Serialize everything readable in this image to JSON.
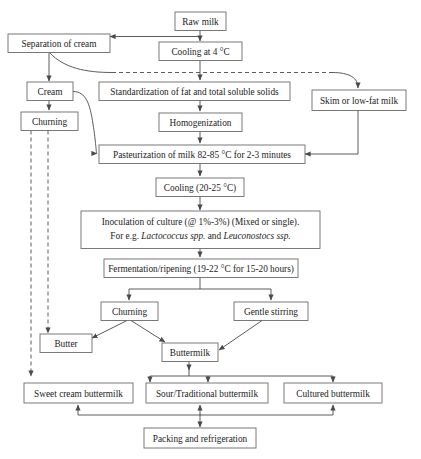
{
  "diagram": {
    "type": "process-flowchart",
    "colors": {
      "box_stroke": "#6b6b6b",
      "edge_stroke": "#4a4a4a",
      "box_fill": "#ffffff",
      "text": "#1b1b1b",
      "background": "#ffffff"
    },
    "nodes": {
      "raw_milk": "Raw milk",
      "separation_of_cream": "Separation of cream",
      "cooling_4c": "Cooling at 4 °C",
      "cream": "Cream",
      "standardization": "Standardization of fat and total soluble solids",
      "skim_milk": "Skim or low-fat milk",
      "churning_top": "Churning",
      "homogenization": "Homogenization",
      "pasteurization": "Pasteurization of milk 82-85 °C for 2-3 minutes",
      "cooling_20_25c": "Cooling (20-25 °C)",
      "inoculation_line1": "Inoculation of culture (@ 1%-3%) (Mixed or single).",
      "inoculation_line2_a": "For e.g. ",
      "inoculation_line2_b": "Lactococcus spp.",
      "inoculation_line2_c": " and ",
      "inoculation_line2_d": "Leuconostocs ssp.",
      "fermentation": "Fermentation/ripening (19-22 °C for 15-20 hours)",
      "churning_bottom": "Churning",
      "gentle_stirring": "Gentle stirring",
      "butter": "Butter",
      "buttermilk": "Buttermilk",
      "sweet_cream_buttermilk": "Sweet cream buttermilk",
      "sour_traditional_buttermilk": "Sour/Traditional buttermilk",
      "cultured_buttermilk": "Cultured buttermilk",
      "packing_refrigeration": "Packing and refrigeration"
    }
  }
}
